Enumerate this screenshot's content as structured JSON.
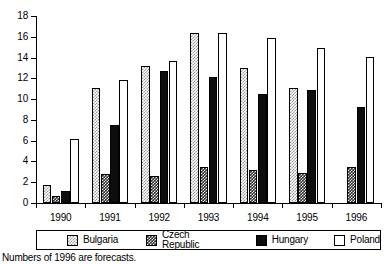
{
  "chart_data": {
    "type": "bar",
    "title": "",
    "subtitle": "",
    "xlabel": "",
    "ylabel": "",
    "categories": [
      "1990",
      "1991",
      "1992",
      "1993",
      "1994",
      "1995",
      "1996"
    ],
    "ylim": [
      0,
      18
    ],
    "yticks": [
      0,
      2,
      4,
      6,
      8,
      10,
      12,
      14,
      16,
      18
    ],
    "grid": false,
    "legend_position": "bottom",
    "series": [
      {
        "name": "Bulgaria",
        "swatch": "light-checker",
        "values": [
          1.7,
          11.1,
          13.2,
          16.4,
          13.0,
          11.1,
          null
        ]
      },
      {
        "name": "Czech Republic",
        "swatch": "dark-checker",
        "values": [
          0.7,
          2.8,
          2.6,
          3.5,
          3.2,
          2.9,
          3.5
        ]
      },
      {
        "name": "Hungary",
        "swatch": "solid-black",
        "values": [
          1.2,
          7.5,
          12.7,
          12.1,
          10.5,
          10.9,
          9.2
        ]
      },
      {
        "name": "Poland",
        "swatch": "white-outline",
        "values": [
          6.2,
          11.8,
          13.7,
          16.4,
          15.9,
          14.9,
          14.1
        ]
      }
    ],
    "annotations": [
      "Numbers of 1996 are forecasts."
    ]
  },
  "footnote": "Numbers of 1996 are forecasts."
}
